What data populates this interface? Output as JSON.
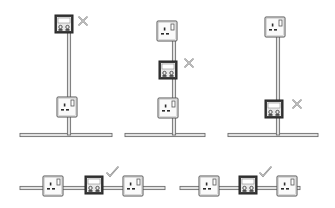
{
  "legend": {
    "incorrect_symbol": "cross-mark",
    "correct_symbol": "check-mark"
  },
  "diagrams": [
    {
      "id": "spur-at-end-of-branch",
      "layout": "vertical",
      "devices": [
        "fused-spur-unit",
        "socket"
      ],
      "verdict": "incorrect"
    },
    {
      "id": "spur-between-sockets-on-branch",
      "layout": "vertical",
      "devices": [
        "socket",
        "fused-spur-unit",
        "socket"
      ],
      "verdict": "incorrect"
    },
    {
      "id": "spur-at-ring-then-socket",
      "layout": "vertical",
      "devices": [
        "socket",
        "fused-spur-unit"
      ],
      "verdict": "incorrect"
    },
    {
      "id": "spur-on-ring-between-sockets-a",
      "layout": "horizontal",
      "devices": [
        "socket",
        "fused-spur-unit",
        "socket"
      ],
      "verdict": "correct"
    },
    {
      "id": "spur-on-ring-between-sockets-b",
      "layout": "horizontal",
      "devices": [
        "socket",
        "fused-spur-unit",
        "socket"
      ],
      "verdict": "correct"
    }
  ],
  "colors": {
    "wire": "#6b6b6b",
    "spur_unit": "#3c3c3c",
    "socket": "#fafafa",
    "mark": "#7a7a7a"
  }
}
